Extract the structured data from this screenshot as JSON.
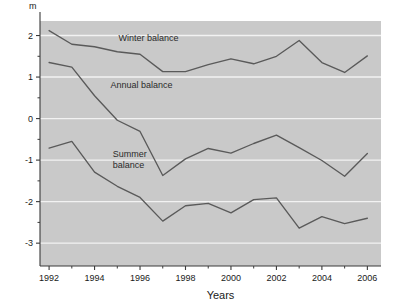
{
  "chart_data": {
    "type": "line",
    "title": "",
    "subtitle": "",
    "xlabel": "Years",
    "ylabel": "m",
    "yunit": "m",
    "x": [
      1992,
      1993,
      1994,
      1995,
      1996,
      1997,
      1998,
      1999,
      2000,
      2001,
      2002,
      2003,
      2004,
      2005,
      2006
    ],
    "xlim": [
      1991.6,
      2006.6
    ],
    "ylim": [
      -3.55,
      2.35
    ],
    "xticks": [
      1992,
      1994,
      1996,
      1998,
      2000,
      2002,
      2004,
      2006
    ],
    "xticklabels": [
      "1992",
      "1994",
      "1996",
      "1998",
      "2000",
      "2002",
      "2004",
      "2006"
    ],
    "xminorticks": [
      1993,
      1995,
      1997,
      1999,
      2001,
      2003,
      2005
    ],
    "yticks": [
      2,
      1,
      0,
      -1,
      -2,
      -3
    ],
    "yticklabels": [
      "2",
      "1",
      "0",
      "-1",
      "-2",
      "-3"
    ],
    "yminorticks": [
      1.5,
      0.5,
      -0.5,
      -1.5,
      -2.5
    ],
    "grid": true,
    "grid_axis": "y",
    "grid_color": "#f2f2f2",
    "plot_bg": "#c9c9c9",
    "figure_bg": "#ffffff",
    "line_color": "#5a5a5a",
    "legend_position": "inline-annotations",
    "series": [
      {
        "name": "Winter balance",
        "label": "Winter balance",
        "label_lines": [
          "Winter balance"
        ],
        "label_x": 1995.05,
        "label_y": 1.86,
        "values": [
          2.12,
          1.79,
          1.73,
          1.61,
          1.55,
          1.13,
          1.13,
          1.3,
          1.44,
          1.32,
          1.5,
          1.88,
          1.35,
          1.11,
          1.51
        ]
      },
      {
        "name": "Annual balance",
        "label": "Annual balance",
        "label_lines": [
          "Annual balance"
        ],
        "label_x": 1994.7,
        "label_y": 0.74,
        "values": [
          1.35,
          1.24,
          0.55,
          -0.04,
          -0.31,
          -1.37,
          -0.97,
          -0.72,
          -0.83,
          -0.6,
          -0.4,
          -0.7,
          -1.01,
          -1.39,
          -0.84
        ]
      },
      {
        "name": "Summer balance",
        "label": "Summer balance",
        "label_lines": [
          "Summer",
          "balance"
        ],
        "label_x": 1994.8,
        "label_y": -0.92,
        "values": [
          -0.71,
          -0.55,
          -1.29,
          -1.63,
          -1.9,
          -2.47,
          -2.1,
          -2.04,
          -2.27,
          -1.95,
          -1.91,
          -2.64,
          -2.36,
          -2.53,
          -2.4
        ]
      }
    ]
  },
  "axes": {
    "y_unit_text": "m",
    "x_title_text": "Years"
  }
}
